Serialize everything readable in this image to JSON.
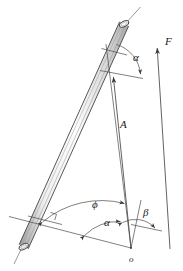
{
  "figure": {
    "type": "engineering-mechanics-diagram",
    "background_color": "#ffffff",
    "line_color": "#3a3a3a",
    "label_color": "#1a1a1a"
  },
  "labels": {
    "alpha_top": "α",
    "alpha_bottom": "α",
    "beta": "β",
    "phi": "ϕ",
    "force_f": "F",
    "vector_a": "A",
    "origin": "o"
  },
  "geometry": {
    "origin_point": {
      "x": 131,
      "y": 248
    },
    "rod": {
      "top_end": {
        "x": 124,
        "y": 26
      },
      "bottom_end": {
        "x": 23,
        "y": 245
      },
      "width_px": 9
    },
    "vectors": [
      {
        "name": "F",
        "from": {
          "x": 167,
          "y": 246
        },
        "to": {
          "x": 156,
          "y": 45
        }
      },
      {
        "name": "A",
        "from": {
          "x": 131,
          "y": 248
        },
        "to": {
          "x": 113,
          "y": 75
        }
      }
    ],
    "angles": [
      {
        "name": "alpha_top",
        "label": "α",
        "vertex": {
          "x": 113,
          "y": 75
        }
      },
      {
        "name": "phi",
        "label": "ϕ",
        "vertex": {
          "x": 131,
          "y": 248
        }
      },
      {
        "name": "alpha_bottom",
        "label": "α",
        "vertex": {
          "x": 131,
          "y": 248
        }
      },
      {
        "name": "beta",
        "label": "β",
        "vertex": {
          "x": 131,
          "y": 248
        }
      }
    ]
  },
  "label_positions": {
    "alpha_top": {
      "x": 133,
      "y": 52
    },
    "force_f": {
      "x": 165,
      "y": 36
    },
    "vector_a": {
      "x": 120,
      "y": 119
    },
    "phi": {
      "x": 92,
      "y": 199
    },
    "alpha_bottom": {
      "x": 104,
      "y": 217
    },
    "beta": {
      "x": 143,
      "y": 207
    },
    "origin": {
      "x": 129,
      "y": 256
    }
  }
}
